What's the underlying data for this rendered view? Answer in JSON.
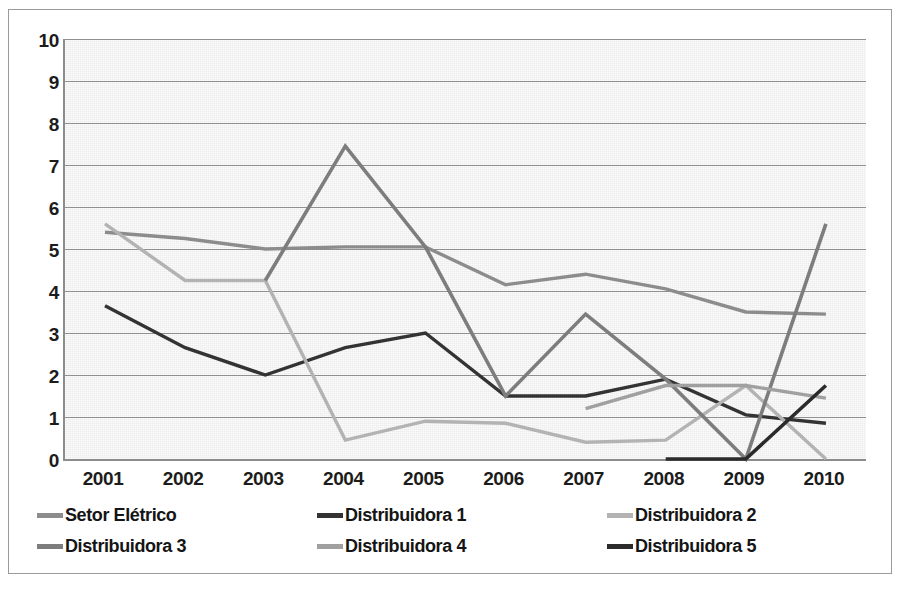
{
  "chart_data": {
    "type": "line",
    "title": "",
    "xlabel": "",
    "ylabel": "",
    "categories": [
      "2001",
      "2002",
      "2003",
      "2004",
      "2005",
      "2006",
      "2007",
      "2008",
      "2009",
      "2010"
    ],
    "ylim": [
      0,
      10
    ],
    "ytick_labels": [
      "0",
      "1",
      "2",
      "3",
      "4",
      "5",
      "6",
      "7",
      "8",
      "9",
      "10"
    ],
    "ytick_values": [
      0,
      1,
      2,
      3,
      4,
      5,
      6,
      7,
      8,
      9,
      10
    ],
    "grid": true,
    "legend_position": "bottom",
    "plot_background": "#ececec",
    "series": [
      {
        "name": "Setor Elétrico",
        "color": "#8c8c8c",
        "width": 3.4,
        "values": [
          5.4,
          5.25,
          5.0,
          5.05,
          5.05,
          4.15,
          4.4,
          4.05,
          3.5,
          3.45
        ]
      },
      {
        "name": "Distribuidora 1",
        "color": "#333333",
        "width": 3.4,
        "values": [
          3.65,
          2.65,
          2.0,
          2.65,
          3.0,
          1.5,
          1.5,
          1.9,
          1.05,
          0.85
        ]
      },
      {
        "name": "Distribuidora 2",
        "color": "#b3b3b3",
        "width": 3.4,
        "values": [
          5.6,
          4.25,
          4.25,
          0.45,
          0.9,
          0.85,
          0.4,
          0.45,
          1.75,
          0.0
        ]
      },
      {
        "name": "Distribuidora 3",
        "color": "#7d7d7d",
        "width": 3.6,
        "values": [
          null,
          null,
          4.25,
          7.45,
          5.05,
          1.5,
          3.45,
          1.9,
          0.0,
          5.6
        ]
      },
      {
        "name": "Distribuidora 4",
        "color": "#a0a0a0",
        "width": 3.4,
        "values": [
          null,
          null,
          null,
          null,
          null,
          null,
          1.2,
          1.75,
          1.75,
          1.45
        ]
      },
      {
        "name": "Distribuidora 5",
        "color": "#2b2b2b",
        "width": 3.6,
        "values": [
          null,
          null,
          null,
          null,
          null,
          null,
          null,
          0.0,
          0.0,
          1.75
        ]
      }
    ]
  },
  "legend": {
    "rows": [
      [
        {
          "label": "Setor Elétrico",
          "color": "#8c8c8c"
        },
        {
          "label": "Distribuidora 1",
          "color": "#333333"
        },
        {
          "label": "Distribuidora 2",
          "color": "#b3b3b3"
        }
      ],
      [
        {
          "label": "Distribuidora 3",
          "color": "#7d7d7d"
        },
        {
          "label": "Distribuidora 4",
          "color": "#a0a0a0"
        },
        {
          "label": "Distribuidora 5",
          "color": "#2b2b2b"
        }
      ]
    ]
  }
}
